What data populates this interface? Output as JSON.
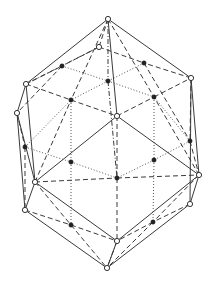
{
  "diagram": {
    "title": "",
    "type": "polyhedron-wireframe",
    "colors": {
      "line": "#3a3a3a",
      "background": "#ffffff",
      "vertex_fill": "#222222"
    },
    "vertices_open": [
      {
        "id": "T",
        "x": 108,
        "y": 19
      },
      {
        "id": "U",
        "x": 99,
        "y": 47
      },
      {
        "id": "L1",
        "x": 26,
        "y": 84
      },
      {
        "id": "L2",
        "x": 17,
        "y": 113
      },
      {
        "id": "R1",
        "x": 191,
        "y": 78
      },
      {
        "id": "C",
        "x": 117,
        "y": 116
      },
      {
        "id": "LM",
        "x": 35,
        "y": 182
      },
      {
        "id": "LL",
        "x": 25,
        "y": 210
      },
      {
        "id": "RM",
        "x": 199,
        "y": 175
      },
      {
        "id": "RL",
        "x": 190,
        "y": 204
      },
      {
        "id": "BF",
        "x": 117,
        "y": 241
      },
      {
        "id": "B",
        "x": 107,
        "y": 268
      }
    ],
    "vertices_filled": [
      {
        "id": "a",
        "x": 62,
        "y": 66
      },
      {
        "id": "b",
        "x": 144,
        "y": 63
      },
      {
        "id": "c",
        "x": 108,
        "y": 81
      },
      {
        "id": "d",
        "x": 71,
        "y": 100
      },
      {
        "id": "e",
        "x": 154,
        "y": 97
      },
      {
        "id": "f",
        "x": 25,
        "y": 147
      },
      {
        "id": "g",
        "x": 190,
        "y": 141
      },
      {
        "id": "h",
        "x": 71,
        "y": 162
      },
      {
        "id": "i",
        "x": 154,
        "y": 160
      },
      {
        "id": "j",
        "x": 117,
        "y": 178
      },
      {
        "id": "k",
        "x": 71,
        "y": 225
      },
      {
        "id": "l",
        "x": 153,
        "y": 222
      }
    ],
    "edges": {
      "solid": [
        [
          "T",
          "L1"
        ],
        [
          "T",
          "R1"
        ],
        [
          "T",
          "C"
        ],
        [
          "L1",
          "LM"
        ],
        [
          "L2",
          "LL"
        ],
        [
          "L1",
          "L2"
        ],
        [
          "R1",
          "RM"
        ],
        [
          "C",
          "LM"
        ],
        [
          "C",
          "RM"
        ],
        [
          "LM",
          "BF"
        ],
        [
          "RM",
          "BF"
        ],
        [
          "LL",
          "B"
        ],
        [
          "RL",
          "B"
        ],
        [
          "LM",
          "LL"
        ],
        [
          "RM",
          "RL"
        ],
        [
          "BF",
          "B"
        ],
        [
          "L2",
          "LM"
        ],
        [
          "R1",
          "RL"
        ]
      ],
      "dashed": [
        [
          "T",
          "U"
        ],
        [
          "U",
          "a"
        ],
        [
          "U",
          "b"
        ],
        [
          "L1",
          "d"
        ],
        [
          "d",
          "C"
        ],
        [
          "C",
          "e"
        ],
        [
          "e",
          "R1"
        ],
        [
          "L1",
          "a"
        ],
        [
          "R1",
          "b"
        ],
        [
          "T",
          "d"
        ],
        [
          "T",
          "e"
        ],
        [
          "LM",
          "j"
        ],
        [
          "j",
          "RM"
        ],
        [
          "C",
          "j"
        ],
        [
          "j",
          "BF"
        ],
        [
          "LM",
          "k"
        ],
        [
          "k",
          "BF"
        ],
        [
          "LL",
          "k"
        ],
        [
          "k",
          "B"
        ],
        [
          "RM",
          "l"
        ],
        [
          "l",
          "BF"
        ],
        [
          "RL",
          "l"
        ],
        [
          "l",
          "B"
        ],
        [
          "L2",
          "f"
        ],
        [
          "f",
          "LL"
        ],
        [
          "R1",
          "g"
        ],
        [
          "g",
          "RM"
        ],
        [
          "LM",
          "d"
        ],
        [
          "RM",
          "e"
        ],
        [
          "a",
          "L2"
        ],
        [
          "b",
          "g"
        ]
      ],
      "dotted": [
        [
          "a",
          "c"
        ],
        [
          "b",
          "c"
        ],
        [
          "c",
          "d"
        ],
        [
          "c",
          "e"
        ],
        [
          "d",
          "h"
        ],
        [
          "e",
          "i"
        ],
        [
          "h",
          "j"
        ],
        [
          "i",
          "j"
        ],
        [
          "f",
          "h"
        ],
        [
          "g",
          "i"
        ],
        [
          "h",
          "k"
        ],
        [
          "i",
          "l"
        ],
        [
          "f",
          "d"
        ],
        [
          "g",
          "e"
        ]
      ],
      "dashdot": [
        [
          "T",
          "c"
        ],
        [
          "c",
          "j"
        ],
        [
          "U",
          "L1"
        ],
        [
          "BF",
          "B"
        ]
      ]
    }
  }
}
